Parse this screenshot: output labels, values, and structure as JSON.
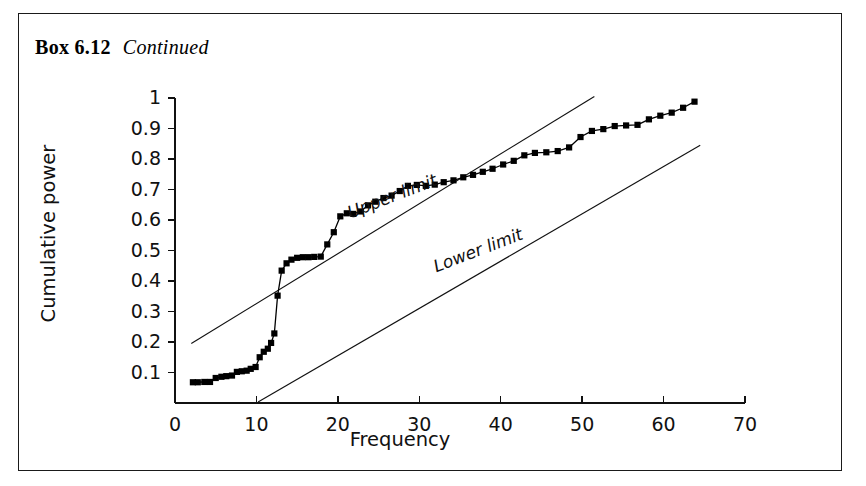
{
  "page": {
    "box_number": "Box 6.12",
    "continued_label": "Continued"
  },
  "chart_data": {
    "type": "line",
    "title": "",
    "xlabel": "Frequency",
    "ylabel": "Cumulative power",
    "xlim": [
      0,
      70
    ],
    "ylim": [
      0,
      1
    ],
    "xticks": [
      0,
      10,
      20,
      30,
      40,
      50,
      60,
      70
    ],
    "yticks": [
      0.1,
      0.2,
      0.3,
      0.4,
      0.5,
      0.6,
      0.7,
      0.8,
      0.9,
      1
    ],
    "ytick_labels": [
      "0.1",
      "0.2",
      "0.3",
      "0.4",
      "0.5",
      "0.6",
      "0.7",
      "0.8",
      "0.9",
      "1"
    ],
    "xtick_labels": [
      "0",
      "10",
      "20",
      "30",
      "40",
      "50",
      "60",
      "70"
    ],
    "grid": false,
    "legend_position": "none",
    "marker": "filled-square",
    "series": [
      {
        "name": "Cumulative power",
        "marker": "square",
        "color": "#000000",
        "x": [
          2.2,
          2.8,
          3.6,
          4.3,
          5.0,
          5.7,
          6.3,
          7.0,
          7.6,
          8.2,
          8.8,
          9.3,
          9.9,
          10.4,
          10.9,
          11.4,
          11.8,
          12.2,
          12.6,
          13.1,
          13.7,
          14.3,
          15.0,
          15.7,
          16.4,
          17.1,
          17.9,
          18.7,
          19.5,
          20.3,
          21.1,
          21.9,
          22.8,
          23.7,
          24.6,
          25.6,
          26.6,
          27.6,
          28.6,
          29.7,
          30.8,
          31.9,
          33.0,
          34.2,
          35.4,
          36.6,
          37.8,
          39.0,
          40.3,
          41.6,
          42.9,
          44.2,
          45.6,
          47.0,
          48.4,
          49.8,
          51.2,
          52.6,
          54.0,
          55.4,
          56.8,
          58.2,
          59.6,
          61.0,
          62.4,
          63.8
        ],
        "y": [
          0.068,
          0.068,
          0.069,
          0.069,
          0.082,
          0.086,
          0.088,
          0.09,
          0.102,
          0.104,
          0.106,
          0.112,
          0.118,
          0.15,
          0.168,
          0.178,
          0.197,
          0.228,
          0.352,
          0.434,
          0.458,
          0.47,
          0.476,
          0.478,
          0.478,
          0.479,
          0.48,
          0.52,
          0.56,
          0.612,
          0.622,
          0.62,
          0.628,
          0.648,
          0.66,
          0.672,
          0.68,
          0.695,
          0.712,
          0.715,
          0.712,
          0.716,
          0.724,
          0.73,
          0.74,
          0.748,
          0.758,
          0.768,
          0.782,
          0.794,
          0.812,
          0.82,
          0.822,
          0.826,
          0.838,
          0.872,
          0.892,
          0.898,
          0.908,
          0.91,
          0.912,
          0.93,
          0.942,
          0.952,
          0.968,
          0.988
        ]
      }
    ],
    "reference_lines": [
      {
        "name": "Upper limit",
        "label": "Upper limit",
        "x0": 2.0,
        "y0": 0.195,
        "x1": 51.5,
        "y1": 1.005,
        "label_angle": -21
      },
      {
        "name": "Lower limit",
        "label": "Lower limit",
        "x0": 10.2,
        "y0": 0.003,
        "x1": 64.5,
        "y1": 0.845,
        "label_angle": -21
      }
    ]
  }
}
